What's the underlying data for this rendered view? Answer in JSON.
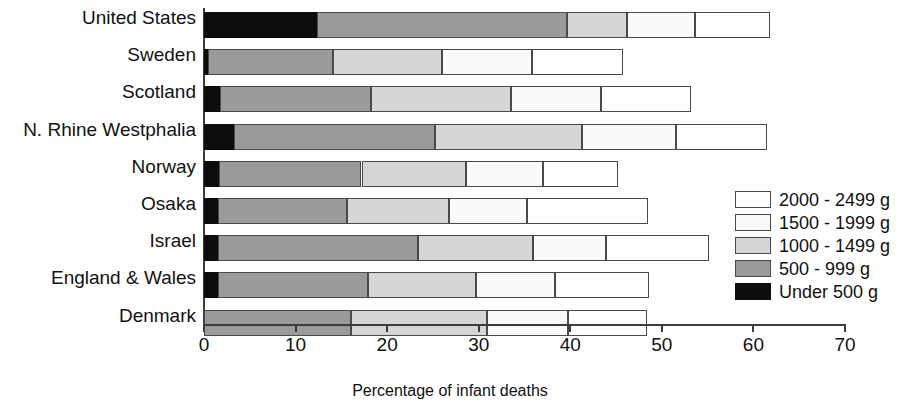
{
  "chart_data": {
    "type": "bar",
    "orientation": "horizontal",
    "stacked": true,
    "title": "",
    "xlabel": "Percentage of infant deaths",
    "ylabel": "",
    "xlim": [
      0,
      70
    ],
    "xticks": [
      0,
      10,
      20,
      30,
      40,
      50,
      60,
      70
    ],
    "grid": false,
    "legend_position": "right",
    "categories": [
      "United States",
      "Sweden",
      "Scotland",
      "N. Rhine Westphalia",
      "Norway",
      "Osaka",
      "Israel",
      "England & Wales",
      "Denmark"
    ],
    "series": [
      {
        "name": "Under 500 g",
        "color": "#0d0d0d",
        "values": [
          12.3,
          0.4,
          1.7,
          3.3,
          1.6,
          1.5,
          1.5,
          1.5,
          0.0
        ]
      },
      {
        "name": "500 - 999 g",
        "color": "#9a9a9a",
        "values": [
          27.3,
          13.7,
          16.5,
          21.9,
          15.6,
          14.1,
          21.9,
          16.4,
          16.0
        ]
      },
      {
        "name": "1000 - 1499 g",
        "color": "#d6d6d6",
        "values": [
          6.6,
          11.9,
          15.3,
          16.1,
          11.4,
          11.2,
          12.5,
          11.8,
          14.9
        ]
      },
      {
        "name": "1500 - 1999 g",
        "color": "#fafafa",
        "values": [
          7.4,
          9.8,
          9.9,
          10.2,
          8.4,
          8.5,
          8.0,
          8.6,
          8.9
        ]
      },
      {
        "name": "2000 - 2499 g",
        "color": "#ffffff",
        "values": [
          8.2,
          10.0,
          9.8,
          10.0,
          8.2,
          13.2,
          11.3,
          10.3,
          8.6
        ]
      }
    ],
    "totals": [
      61.8,
      45.8,
      53.2,
      61.5,
      45.2,
      48.4,
      55.2,
      48.6,
      48.4
    ]
  },
  "legend": {
    "items": [
      {
        "label": "2000 - 2499 g",
        "color": "#ffffff"
      },
      {
        "label": "1500 - 1999 g",
        "color": "#fafafa"
      },
      {
        "label": "1000 - 1499 g",
        "color": "#d6d6d6"
      },
      {
        "label": "500 - 999 g",
        "color": "#9a9a9a"
      },
      {
        "label": "Under 500 g",
        "color": "#0d0d0d"
      }
    ]
  },
  "axis": {
    "x_title": "Percentage of infant deaths",
    "tick_labels": [
      "0",
      "10",
      "20",
      "30",
      "40",
      "50",
      "60",
      "70"
    ]
  }
}
